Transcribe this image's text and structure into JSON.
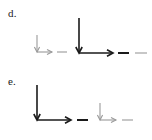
{
  "figure": {
    "title": "",
    "background_color": "#ffffff",
    "width": 152,
    "height": 140,
    "stroke_dark": "#1a1a1a",
    "stroke_light": "#9a9a9a",
    "rows": [
      {
        "id": "d",
        "label": "d.",
        "label_x": 8,
        "label_y": 8,
        "groups": [
          {
            "id": "d-group-1",
            "weight": "light",
            "color": "#9a9a9a",
            "down_arrow": {
              "x": 37,
              "y1": 35,
              "y2": 52,
              "stroke": 1.1
            },
            "right_arrow": {
              "y": 52,
              "x1": 37,
              "x2": 52,
              "stroke": 1.1
            },
            "dashes": [
              {
                "x1": 57,
                "x2": 67,
                "y": 52,
                "weight": "light",
                "stroke": 1.1
              }
            ]
          },
          {
            "id": "d-group-2",
            "weight": "bold",
            "color": "#1a1a1a",
            "down_arrow": {
              "x": 79,
              "y1": 18,
              "y2": 53,
              "stroke": 1.6
            },
            "right_arrow": {
              "y": 53,
              "x1": 79,
              "x2": 113,
              "stroke": 1.6
            },
            "dashes": [
              {
                "x1": 118,
                "x2": 129,
                "y": 53,
                "weight": "bold",
                "stroke": 2.0
              },
              {
                "x1": 135,
                "x2": 147,
                "y": 53,
                "weight": "light",
                "stroke": 1.1
              }
            ]
          }
        ]
      },
      {
        "id": "e",
        "label": "e.",
        "label_x": 8,
        "label_y": 76,
        "groups": [
          {
            "id": "e-group-1",
            "weight": "bold",
            "color": "#1a1a1a",
            "down_arrow": {
              "x": 37,
              "y1": 85,
              "y2": 120,
              "stroke": 1.6
            },
            "right_arrow": {
              "y": 120,
              "x1": 37,
              "x2": 71,
              "stroke": 1.6
            },
            "dashes": [
              {
                "x1": 77,
                "x2": 88,
                "y": 120,
                "weight": "bold",
                "stroke": 2.0
              }
            ]
          },
          {
            "id": "e-group-2",
            "weight": "light",
            "color": "#9a9a9a",
            "down_arrow": {
              "x": 100,
              "y1": 103,
              "y2": 120,
              "stroke": 1.1
            },
            "right_arrow": {
              "y": 120,
              "x1": 100,
              "x2": 116,
              "stroke": 1.1
            },
            "dashes": [
              {
                "x1": 122,
                "x2": 133,
                "y": 120,
                "weight": "light",
                "stroke": 1.1
              }
            ]
          }
        ]
      }
    ]
  }
}
